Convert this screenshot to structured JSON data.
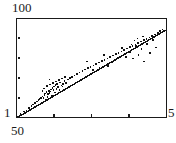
{
  "figure": {
    "background_color": "#ffffff",
    "frame_color": "#1a1a1a",
    "point_color": "#111111",
    "line_color": "#111111"
  },
  "axes": {
    "y_max_label": "100",
    "y_min_label": "1",
    "x_min_label": "50",
    "x_max_label": "5",
    "y_tick_count": 6,
    "x_tick_count": 5
  },
  "chart_data": {
    "type": "scatter",
    "title": "",
    "subtitle": "",
    "xlabel": "",
    "ylabel": "",
    "xscale": "log",
    "yscale": "log",
    "xlim": [
      50,
      5
    ],
    "ylim": [
      1,
      100
    ],
    "x_tick_labels": [
      "50",
      "",
      "",
      "",
      "5"
    ],
    "y_tick_labels": [
      "100",
      "",
      "",
      "",
      "",
      "1"
    ],
    "grid": false,
    "legend": null,
    "legend_position": "none",
    "annotations": [],
    "series": [
      {
        "name": "observations",
        "type": "scatter",
        "marker": "square",
        "marker_size": 1.6,
        "points": [
          [
            17.8,
            116.4
          ],
          [
            20.6,
            114.2
          ],
          [
            24.0,
            111.5
          ],
          [
            26.5,
            110.3
          ],
          [
            28.8,
            108.2
          ],
          [
            31.4,
            106.0
          ],
          [
            33.0,
            104.4
          ],
          [
            35.2,
            103.0
          ],
          [
            36.8,
            101.4
          ],
          [
            38.3,
            100.2
          ],
          [
            39.6,
            99.0
          ],
          [
            41.0,
            97.8
          ],
          [
            42.4,
            96.4
          ],
          [
            43.6,
            98.2
          ],
          [
            44.5,
            95.0
          ],
          [
            45.2,
            93.6
          ],
          [
            45.9,
            99.4
          ],
          [
            46.6,
            92.2
          ],
          [
            47.4,
            96.8
          ],
          [
            48.1,
            94.2
          ],
          [
            48.9,
            90.8
          ],
          [
            49.6,
            93.0
          ],
          [
            50.3,
            91.5
          ],
          [
            51.0,
            89.4
          ],
          [
            51.8,
            95.6
          ],
          [
            52.5,
            88.0
          ],
          [
            53.3,
            90.2
          ],
          [
            54.0,
            86.6
          ],
          [
            54.8,
            92.6
          ],
          [
            55.5,
            85.2
          ],
          [
            56.4,
            88.8
          ],
          [
            57.2,
            83.8
          ],
          [
            58.2,
            87.0
          ],
          [
            59.4,
            90.0
          ],
          [
            60.2,
            82.4
          ],
          [
            61.5,
            85.6
          ],
          [
            63.0,
            84.0
          ],
          [
            64.6,
            81.0
          ],
          [
            66.2,
            82.8
          ],
          [
            68.0,
            79.6
          ],
          [
            70.0,
            78.2
          ],
          [
            72.2,
            76.8
          ],
          [
            74.5,
            75.4
          ],
          [
            77.0,
            74.0
          ],
          [
            79.6,
            72.6
          ],
          [
            82.4,
            71.0
          ],
          [
            85.0,
            69.6
          ],
          [
            87.8,
            68.2
          ],
          [
            90.6,
            66.8
          ],
          [
            93.4,
            65.4
          ],
          [
            96.2,
            64.0
          ],
          [
            99.0,
            62.6
          ],
          [
            101.8,
            61.2
          ],
          [
            104.6,
            59.8
          ],
          [
            107.4,
            58.4
          ],
          [
            110.2,
            57.0
          ],
          [
            93.2,
            70.0
          ],
          [
            99.5,
            67.5
          ],
          [
            104.0,
            55.0
          ],
          [
            87.0,
            61.5
          ],
          [
            113.0,
            55.6
          ],
          [
            115.8,
            54.2
          ],
          [
            118.6,
            52.8
          ],
          [
            121.4,
            51.4
          ],
          [
            124.2,
            50.0
          ],
          [
            127.0,
            48.6
          ],
          [
            129.8,
            47.2
          ],
          [
            132.6,
            45.8
          ],
          [
            135.4,
            44.4
          ],
          [
            138.2,
            43.0
          ],
          [
            141.0,
            41.6
          ],
          [
            143.8,
            40.2
          ],
          [
            146.6,
            38.8
          ],
          [
            149.4,
            37.4
          ],
          [
            152.2,
            36.0
          ],
          [
            155.0,
            34.6
          ],
          [
            157.8,
            33.2
          ],
          [
            160.0,
            31.0
          ],
          [
            162.4,
            29.6
          ],
          [
            126.0,
            57.0
          ],
          [
            130.0,
            52.0
          ],
          [
            133.0,
            58.5
          ],
          [
            136.0,
            46.0
          ],
          [
            138.5,
            55.0
          ],
          [
            141.5,
            49.0
          ],
          [
            144.0,
            61.5
          ],
          [
            147.0,
            44.0
          ],
          [
            150.0,
            53.0
          ],
          [
            153.0,
            40.0
          ],
          [
            156.0,
            47.5
          ],
          [
            131.5,
            44.5
          ],
          [
            134.5,
            40.5
          ],
          [
            143.0,
            36.5
          ],
          [
            137.5,
            38.5
          ],
          [
            122.0,
            48.0
          ],
          [
            118.0,
            58.0
          ],
          [
            112.0,
            62.5
          ],
          [
            108.0,
            66.0
          ],
          [
            44.0,
            88.5
          ],
          [
            47.0,
            86.0
          ],
          [
            50.0,
            84.5
          ],
          [
            53.0,
            83.0
          ],
          [
            56.0,
            81.5
          ],
          [
            59.0,
            80.0
          ],
          [
            62.0,
            78.5
          ],
          [
            65.0,
            77.0
          ],
          [
            42.5,
            91.0
          ],
          [
            49.5,
            79.5
          ],
          [
            57.5,
            94.0
          ],
          [
            62.5,
            86.5
          ]
        ]
      },
      {
        "name": "fit-line",
        "type": "line",
        "endpoints": [
          [
            19.0,
            116.5
          ],
          [
            165.0,
            30.5
          ]
        ]
      }
    ]
  }
}
